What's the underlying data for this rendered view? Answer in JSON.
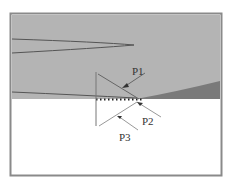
{
  "diagram": {
    "labels": {
      "p1": "P1",
      "p2": "P2",
      "p3": "P3"
    },
    "colors": {
      "frame": "#8a8a8a",
      "upper_region": "#b4b4b4",
      "dark_wedge": "#7a7a7a",
      "lower_region": "#ffffff",
      "line": "#555555",
      "light_line": "#999999",
      "arrow": "#333333"
    }
  }
}
